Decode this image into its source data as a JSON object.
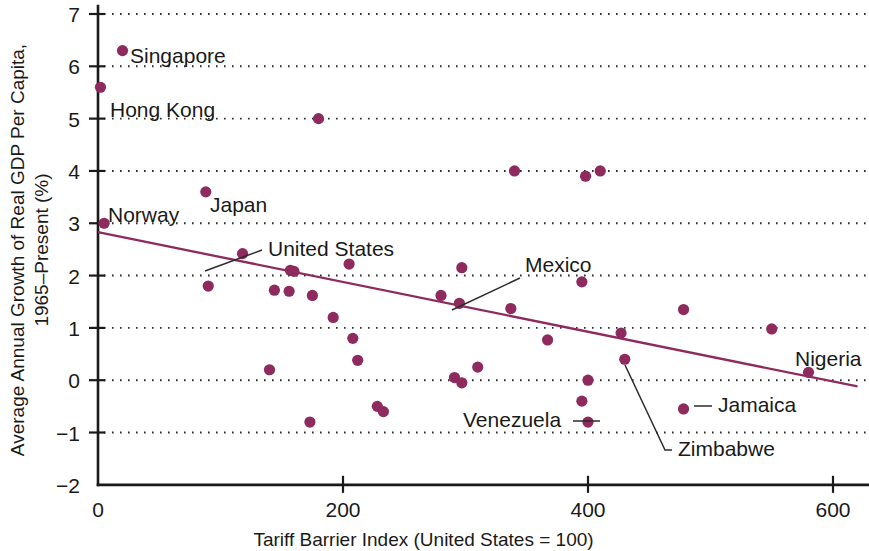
{
  "chart_data": {
    "type": "scatter",
    "title": "",
    "xlabel": "Tariff Barrier Index (United States = 100)",
    "ylabel": "Average Annual Growth of Real GDP Per Capita, 1965–Present (%)",
    "ylabel_line1": "Average Annual Growth of Real GDP Per Capita,",
    "ylabel_line2": "1965–Present (%)",
    "xlim": [
      0,
      620
    ],
    "ylim": [
      -2,
      7
    ],
    "xticks": [
      0,
      200,
      400,
      600
    ],
    "xtick_labels": [
      "0",
      "200",
      "400",
      "600"
    ],
    "yticks": [
      -2,
      -1,
      0,
      1,
      2,
      3,
      4,
      5,
      6,
      7
    ],
    "ytick_labels": [
      "−2",
      "−1",
      "0",
      "1",
      "2",
      "3",
      "4",
      "5",
      "6",
      "7"
    ],
    "grid": "horizontal-dotted",
    "legend": "none",
    "marker_color": "#8e2a5e",
    "trendline_color": "#8e2a5e",
    "axis_color": "#1a1a1a",
    "background_color": "#ffffff",
    "points": [
      {
        "x": 20,
        "y": 6.3,
        "label": "Singapore"
      },
      {
        "x": 2,
        "y": 5.6,
        "label": "Hong Kong"
      },
      {
        "x": 180,
        "y": 5.0,
        "label": ""
      },
      {
        "x": 340,
        "y": 4.0,
        "label": ""
      },
      {
        "x": 398,
        "y": 3.9,
        "label": ""
      },
      {
        "x": 410,
        "y": 4.0,
        "label": ""
      },
      {
        "x": 88,
        "y": 3.6,
        "label": "Japan"
      },
      {
        "x": 5,
        "y": 3.0,
        "label": "Norway"
      },
      {
        "x": 118,
        "y": 2.42,
        "label": "United States"
      },
      {
        "x": 205,
        "y": 2.22,
        "label": ""
      },
      {
        "x": 157,
        "y": 2.1,
        "label": ""
      },
      {
        "x": 160,
        "y": 2.08,
        "label": ""
      },
      {
        "x": 297,
        "y": 2.15,
        "label": ""
      },
      {
        "x": 395,
        "y": 1.88,
        "label": ""
      },
      {
        "x": 90,
        "y": 1.8,
        "label": ""
      },
      {
        "x": 144,
        "y": 1.72,
        "label": ""
      },
      {
        "x": 156,
        "y": 1.7,
        "label": ""
      },
      {
        "x": 175,
        "y": 1.62,
        "label": ""
      },
      {
        "x": 280,
        "y": 1.62,
        "label": ""
      },
      {
        "x": 295,
        "y": 1.47,
        "label": "Mexico"
      },
      {
        "x": 337,
        "y": 1.37,
        "label": ""
      },
      {
        "x": 478,
        "y": 1.35,
        "label": ""
      },
      {
        "x": 192,
        "y": 1.2,
        "label": ""
      },
      {
        "x": 550,
        "y": 0.98,
        "label": ""
      },
      {
        "x": 367,
        "y": 0.77,
        "label": ""
      },
      {
        "x": 208,
        "y": 0.8,
        "label": ""
      },
      {
        "x": 427,
        "y": 0.9,
        "label": ""
      },
      {
        "x": 212,
        "y": 0.38,
        "label": ""
      },
      {
        "x": 430,
        "y": 0.4,
        "label": "Zimbabwe"
      },
      {
        "x": 580,
        "y": 0.15,
        "label": "Nigeria"
      },
      {
        "x": 140,
        "y": 0.2,
        "label": ""
      },
      {
        "x": 310,
        "y": 0.25,
        "label": ""
      },
      {
        "x": 291,
        "y": 0.05,
        "label": ""
      },
      {
        "x": 297,
        "y": -0.05,
        "label": ""
      },
      {
        "x": 400,
        "y": 0.0,
        "label": ""
      },
      {
        "x": 395,
        "y": -0.4,
        "label": ""
      },
      {
        "x": 228,
        "y": -0.5,
        "label": ""
      },
      {
        "x": 233,
        "y": -0.6,
        "label": ""
      },
      {
        "x": 478,
        "y": -0.55,
        "label": "Jamaica"
      },
      {
        "x": 400,
        "y": -0.8,
        "label": "Venezuela"
      },
      {
        "x": 173,
        "y": -0.8,
        "label": ""
      }
    ],
    "trendline": {
      "x0": 0,
      "y0": 2.83,
      "x1": 620,
      "y1": -0.12
    },
    "annotations": [
      {
        "text": "Singapore",
        "anchor": "start",
        "tx": 130,
        "ty": 63,
        "leader": null
      },
      {
        "text": "Hong Kong",
        "anchor": "start",
        "tx": 110,
        "ty": 117,
        "leader": null
      },
      {
        "text": "Japan",
        "anchor": "start",
        "tx": 210,
        "ty": 212,
        "leader": null
      },
      {
        "text": "Norway",
        "anchor": "start",
        "tx": 108,
        "ty": 222,
        "leader": null
      },
      {
        "text": "United States",
        "anchor": "start",
        "tx": 268,
        "ty": 256,
        "leader": "M262,250 L205,271"
      },
      {
        "text": "Mexico",
        "anchor": "start",
        "tx": 525,
        "ty": 272,
        "leader": "M520,278 L452,310"
      },
      {
        "text": "Nigeria",
        "anchor": "start",
        "tx": 795,
        "ty": 366,
        "leader": null
      },
      {
        "text": "Jamaica",
        "anchor": "start",
        "tx": 718,
        "ty": 412,
        "leader": "M712,406 L694,406"
      },
      {
        "text": "Venezuela",
        "anchor": "start",
        "tx": 463,
        "ty": 427,
        "leader": "M573,421 L600,421"
      },
      {
        "text": "Zimbabwe",
        "anchor": "start",
        "tx": 678,
        "ty": 456,
        "leader": "M625,365 L665,450 L672,450"
      }
    ]
  }
}
